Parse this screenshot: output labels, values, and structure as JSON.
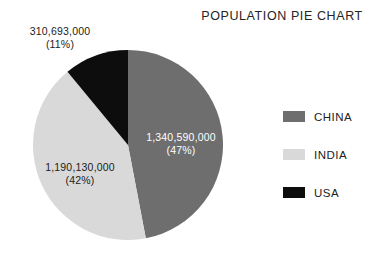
{
  "chart_data": {
    "type": "pie",
    "title": "POPULATION PIE CHART",
    "xlabel": "",
    "ylabel": "",
    "legend_position": "right",
    "grid": false,
    "categories": [
      "CHINA",
      "INDIA",
      "USA"
    ],
    "values": [
      1340590000,
      1190130000,
      310693000
    ],
    "percentages": [
      47,
      42,
      11
    ],
    "colors": [
      "#6e6e6e",
      "#d9d9d9",
      "#0d0d0d"
    ],
    "start_angle_deg": 0,
    "direction": "clockwise",
    "slices": [
      {
        "name": "CHINA",
        "value": 1340590000,
        "percent": 47,
        "color": "#6e6e6e",
        "value_text": "1,340,590,000",
        "percent_text": "(47%)",
        "label_placement": "inside"
      },
      {
        "name": "INDIA",
        "value": 1190130000,
        "percent": 42,
        "color": "#d9d9d9",
        "value_text": "1,190,130,000",
        "percent_text": "(42%)",
        "label_placement": "inside"
      },
      {
        "name": "USA",
        "value": 310693000,
        "percent": 11,
        "color": "#0d0d0d",
        "value_text": "310,693,000",
        "percent_text": "(11%)",
        "label_placement": "outside"
      }
    ]
  },
  "header": {
    "title": "POPULATION PIE CHART"
  },
  "labels": {
    "china": {
      "value": "1,340,590,000",
      "percent": "(47%)"
    },
    "india": {
      "value": "1,190,130,000",
      "percent": "(42%)"
    },
    "usa": {
      "value": "310,693,000",
      "percent": "(11%)"
    }
  },
  "legend": {
    "items": [
      {
        "label": "CHINA",
        "color": "#6e6e6e"
      },
      {
        "label": "INDIA",
        "color": "#d9d9d9"
      },
      {
        "label": "USA",
        "color": "#0d0d0d"
      }
    ]
  },
  "palette": {
    "background": "#ffffff",
    "text": "#1c1c1c",
    "china": "#6e6e6e",
    "india": "#d9d9d9",
    "usa": "#0d0d0d"
  }
}
